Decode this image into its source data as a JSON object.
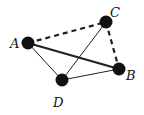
{
  "diagram": {
    "type": "graph",
    "nodes": [
      {
        "id": "A",
        "label": "A",
        "x": 28,
        "y": 43,
        "label_x": 10,
        "label_y": 48
      },
      {
        "id": "B",
        "label": "B",
        "x": 119,
        "y": 69,
        "label_x": 126,
        "label_y": 80
      },
      {
        "id": "C",
        "label": "C",
        "x": 106,
        "y": 22,
        "label_x": 110,
        "label_y": 17
      },
      {
        "id": "D",
        "label": "D",
        "x": 62,
        "y": 80,
        "label_x": 53,
        "label_y": 107
      }
    ],
    "edges": [
      {
        "from": "A",
        "to": "C",
        "style": "dashed",
        "weight": "thick"
      },
      {
        "from": "C",
        "to": "B",
        "style": "dashed",
        "weight": "thick"
      },
      {
        "from": "A",
        "to": "B",
        "style": "solid",
        "weight": "thick"
      },
      {
        "from": "A",
        "to": "D",
        "style": "solid",
        "weight": "thin"
      },
      {
        "from": "D",
        "to": "B",
        "style": "solid",
        "weight": "thin"
      },
      {
        "from": "C",
        "to": "D",
        "style": "solid",
        "weight": "thin"
      }
    ],
    "colors": {
      "node": "#111111",
      "edge": "#222222",
      "background": "#ffffff"
    }
  }
}
